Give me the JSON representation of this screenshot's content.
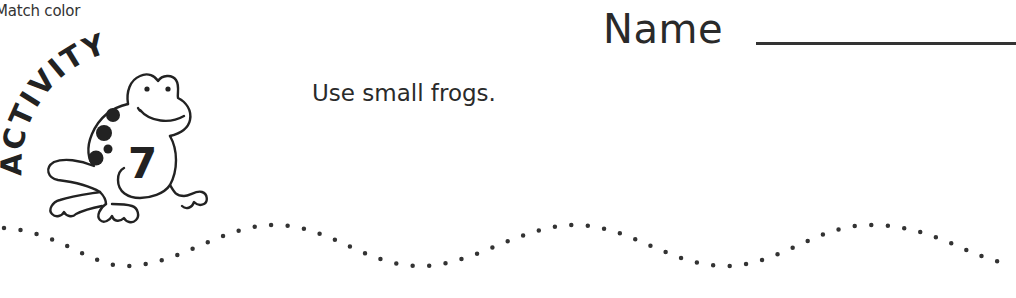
{
  "header": {
    "activity_label": "Match color"
  },
  "name_field": {
    "label": "Name",
    "value": ""
  },
  "badge": {
    "word": "ACTIVITY",
    "number": "7",
    "icon": "frog-icon"
  },
  "instruction": "Use small frogs.",
  "tracing_line": {
    "style": "dotted-wave",
    "color": "#333333"
  }
}
